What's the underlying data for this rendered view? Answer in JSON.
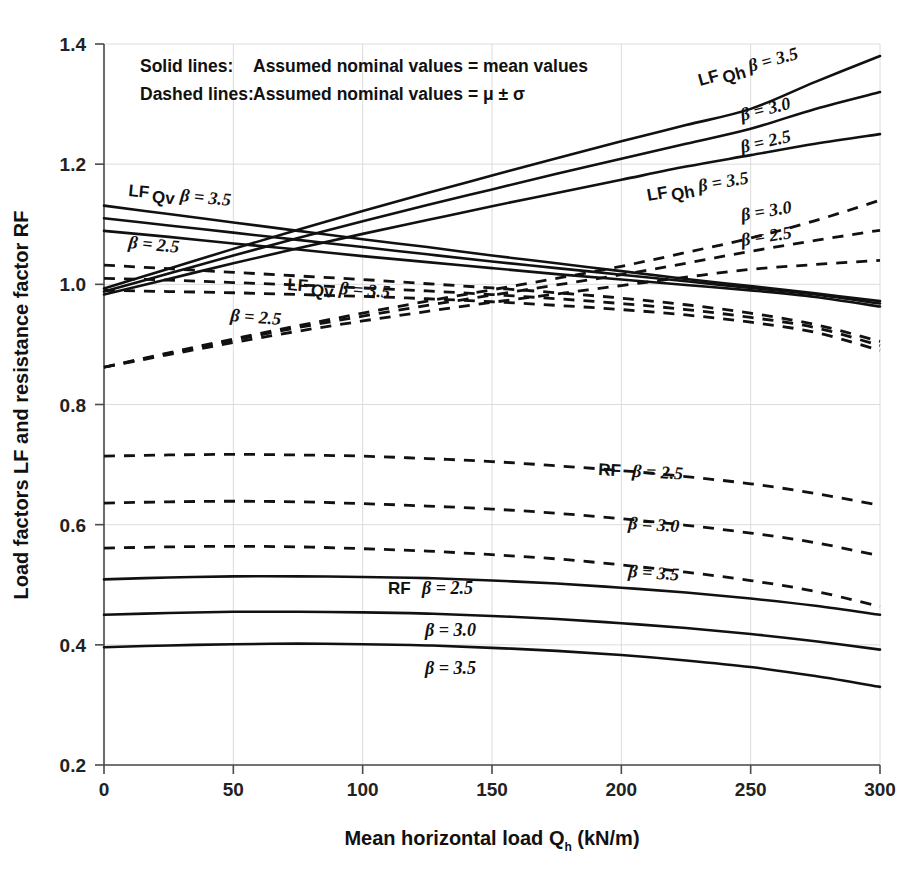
{
  "figure": {
    "background": "#ffffff",
    "ink": "#111111",
    "grid_color": "#d8d8d8"
  },
  "legend": {
    "line1_key": "Solid lines:",
    "line1_value": "Assumed nominal values = mean values",
    "line2_key": "Dashed lines:",
    "line2_value": "Assumed nominal values = μ ± σ"
  },
  "axes": {
    "x_title_main": "Mean horizontal load Q",
    "x_title_sub": "h",
    "x_title_unit": "  (kN/m)",
    "y_title_a": "Load factors ",
    "y_title_b": "LF",
    "y_title_c": " and resistance factor ",
    "y_title_d": "RF",
    "x_ticks": [
      "0",
      "50",
      "100",
      "150",
      "200",
      "250",
      "300"
    ],
    "y_ticks": [
      "0.2",
      "0.4",
      "0.6",
      "0.8",
      "1.0",
      "1.2",
      "1.4"
    ]
  },
  "annotations": [
    {
      "name": "lf-qh-solid-35",
      "prefix": "LF",
      "sub": "Qh",
      "beta": "β = 3.5",
      "x": 700,
      "y": 86,
      "rot": -15.5
    },
    {
      "name": "lf-qh-solid-30",
      "prefix": "",
      "sub": "",
      "beta": "β = 3.0",
      "x": 742,
      "y": 121,
      "rot": -14.0
    },
    {
      "name": "lf-qh-solid-25",
      "prefix": "",
      "sub": "",
      "beta": "β = 2.5",
      "x": 742,
      "y": 153,
      "rot": -13.0
    },
    {
      "name": "lf-qh-dashed-35",
      "prefix": "LF",
      "sub": "Qh",
      "beta": "β = 3.5",
      "x": 648,
      "y": 201,
      "rot": -10.0
    },
    {
      "name": "lf-qh-dashed-30",
      "prefix": "",
      "sub": "",
      "beta": "β = 3.0",
      "x": 742,
      "y": 221,
      "rot": -9.5
    },
    {
      "name": "lf-qh-dashed-25",
      "prefix": "",
      "sub": "",
      "beta": "β = 2.5",
      "x": 742,
      "y": 246,
      "rot": -9.0
    },
    {
      "name": "lf-qv-solid-35",
      "prefix": "LF",
      "sub": "Qv",
      "beta": "β = 3.5",
      "x": 128,
      "y": 196,
      "rot": 5.5
    },
    {
      "name": "lf-qv-solid-25",
      "prefix": "",
      "sub": "",
      "beta": "β = 2.5",
      "x": 128,
      "y": 248,
      "rot": 5.5
    },
    {
      "name": "lf-qv-dashed-35",
      "prefix": "LF",
      "sub": "Qv",
      "beta": "β = 3.5",
      "x": 287,
      "y": 290,
      "rot": 4.5
    },
    {
      "name": "lf-qv-dashed-25",
      "prefix": "",
      "sub": "",
      "beta": "β = 2.5",
      "x": 230,
      "y": 321,
      "rot": 4.5
    },
    {
      "name": "rf-dashed-25",
      "prefix": "RF",
      "sub": "",
      "beta": "β = 2.5",
      "x": 598,
      "y": 475,
      "rot": 3.0
    },
    {
      "name": "rf-dashed-30",
      "prefix": "",
      "sub": "",
      "beta": "β = 3.0",
      "x": 628,
      "y": 529,
      "rot": 3.5
    },
    {
      "name": "rf-dashed-35",
      "prefix": "",
      "sub": "",
      "beta": "β = 3.5",
      "x": 628,
      "y": 577,
      "rot": 4.0
    },
    {
      "name": "rf-solid-25",
      "prefix": "RF",
      "sub": "",
      "beta": "β = 2.5",
      "x": 388,
      "y": 594,
      "rot": 0
    },
    {
      "name": "rf-solid-30",
      "prefix": "",
      "sub": "",
      "beta": "β = 3.0",
      "x": 425,
      "y": 636,
      "rot": 0
    },
    {
      "name": "rf-solid-35",
      "prefix": "",
      "sub": "",
      "beta": "β = 3.5",
      "x": 425,
      "y": 674,
      "rot": 0
    }
  ],
  "chart_data": {
    "type": "line",
    "title": "",
    "xlabel": "Mean horizontal load Qh (kN/m)",
    "ylabel": "Load factors LF and resistance factor RF",
    "xlim": [
      0,
      300
    ],
    "ylim": [
      0.2,
      1.4
    ],
    "grid": true,
    "legend_position": "inside-top-left",
    "x": [
      0,
      25,
      50,
      75,
      100,
      125,
      150,
      175,
      200,
      225,
      250,
      275,
      300
    ],
    "series": [
      {
        "name": "LF_Qh  β = 3.5 (solid)",
        "group": "LF_Qh",
        "beta": 3.5,
        "style": "solid",
        "values": [
          0.993,
          1.026,
          1.059,
          1.091,
          1.122,
          1.152,
          1.181,
          1.21,
          1.238,
          1.265,
          1.292,
          1.337,
          1.38
        ]
      },
      {
        "name": "LF_Qh  β = 3.0 (solid)",
        "group": "LF_Qh",
        "beta": 3.0,
        "style": "solid",
        "values": [
          0.988,
          1.018,
          1.048,
          1.077,
          1.105,
          1.132,
          1.158,
          1.184,
          1.209,
          1.234,
          1.259,
          1.292,
          1.32
        ]
      },
      {
        "name": "LF_Qh  β = 2.5 (solid)",
        "group": "LF_Qh",
        "beta": 2.5,
        "style": "solid",
        "values": [
          0.983,
          1.009,
          1.035,
          1.06,
          1.084,
          1.107,
          1.13,
          1.152,
          1.174,
          1.196,
          1.215,
          1.234,
          1.25
        ]
      },
      {
        "name": "LF_Qh  β = 3.5 (dashed)",
        "group": "LF_Qh",
        "beta": 3.5,
        "style": "dashed",
        "values": [
          0.862,
          0.886,
          0.909,
          0.931,
          0.952,
          0.972,
          0.991,
          1.01,
          1.03,
          1.053,
          1.077,
          1.106,
          1.14
        ]
      },
      {
        "name": "LF_Qh  β = 3.0 (dashed)",
        "group": "LF_Qh",
        "beta": 3.0,
        "style": "dashed",
        "values": [
          0.862,
          0.885,
          0.907,
          0.928,
          0.947,
          0.965,
          0.982,
          0.999,
          1.016,
          1.035,
          1.055,
          1.073,
          1.09
        ]
      },
      {
        "name": "LF_Qh  β = 2.5 (dashed)",
        "group": "LF_Qh",
        "beta": 2.5,
        "style": "dashed",
        "values": [
          0.862,
          0.883,
          0.903,
          0.922,
          0.939,
          0.955,
          0.97,
          0.984,
          0.998,
          1.012,
          1.025,
          1.033,
          1.04
        ]
      },
      {
        "name": "LF_Qv  β = 3.5 (solid)",
        "group": "LF_Qv",
        "beta": 3.5,
        "style": "solid",
        "values": [
          1.131,
          1.117,
          1.103,
          1.089,
          1.075,
          1.062,
          1.048,
          1.035,
          1.022,
          1.009,
          0.997,
          0.985,
          0.972
        ]
      },
      {
        "name": "LF_Qv  β = 3.0 (solid)",
        "group": "LF_Qv",
        "beta": 3.0,
        "style": "solid",
        "values": [
          1.11,
          1.098,
          1.086,
          1.074,
          1.062,
          1.05,
          1.038,
          1.027,
          1.016,
          1.005,
          0.994,
          0.983,
          0.968
        ]
      },
      {
        "name": "LF_Qv  β = 2.5 (solid)",
        "group": "LF_Qv",
        "beta": 2.5,
        "style": "solid",
        "values": [
          1.089,
          1.079,
          1.068,
          1.058,
          1.047,
          1.037,
          1.027,
          1.017,
          1.008,
          0.999,
          0.99,
          0.979,
          0.963
        ]
      },
      {
        "name": "LF_Qv  β = 3.5 (dashed)",
        "group": "LF_Qv",
        "beta": 3.5,
        "style": "dashed",
        "values": [
          1.032,
          1.026,
          1.02,
          1.014,
          1.008,
          1.001,
          0.994,
          0.986,
          0.977,
          0.966,
          0.952,
          0.933,
          0.905
        ]
      },
      {
        "name": "LF_Qv  β = 3.0 (dashed)",
        "group": "LF_Qv",
        "beta": 3.0,
        "style": "dashed",
        "values": [
          1.01,
          1.007,
          1.003,
          0.999,
          0.994,
          0.989,
          0.983,
          0.976,
          0.968,
          0.958,
          0.945,
          0.928,
          0.898
        ]
      },
      {
        "name": "LF_Qv  β = 2.5 (dashed)",
        "group": "LF_Qv",
        "beta": 2.5,
        "style": "dashed",
        "values": [
          0.99,
          0.988,
          0.986,
          0.983,
          0.98,
          0.976,
          0.971,
          0.965,
          0.958,
          0.949,
          0.937,
          0.92,
          0.89
        ]
      },
      {
        "name": "RF  β = 2.5 (dashed)",
        "group": "RF",
        "beta": 2.5,
        "style": "dashed",
        "values": [
          0.714,
          0.716,
          0.717,
          0.716,
          0.714,
          0.71,
          0.705,
          0.698,
          0.69,
          0.68,
          0.668,
          0.652,
          0.632
        ]
      },
      {
        "name": "RF  β = 3.0 (dashed)",
        "group": "RF",
        "beta": 3.0,
        "style": "dashed",
        "values": [
          0.636,
          0.638,
          0.639,
          0.638,
          0.635,
          0.631,
          0.626,
          0.619,
          0.61,
          0.599,
          0.586,
          0.57,
          0.548
        ]
      },
      {
        "name": "RF  β = 3.5 (dashed)",
        "group": "RF",
        "beta": 3.5,
        "style": "dashed",
        "values": [
          0.561,
          0.563,
          0.564,
          0.563,
          0.56,
          0.556,
          0.55,
          0.543,
          0.533,
          0.521,
          0.507,
          0.489,
          0.464
        ]
      },
      {
        "name": "RF  β = 2.5 (solid)",
        "group": "RF",
        "beta": 2.5,
        "style": "solid",
        "values": [
          0.509,
          0.512,
          0.514,
          0.514,
          0.513,
          0.511,
          0.507,
          0.502,
          0.495,
          0.487,
          0.477,
          0.465,
          0.45
        ]
      },
      {
        "name": "RF  β = 3.0 (solid)",
        "group": "RF",
        "beta": 3.0,
        "style": "solid",
        "values": [
          0.45,
          0.453,
          0.455,
          0.455,
          0.454,
          0.452,
          0.448,
          0.443,
          0.436,
          0.428,
          0.418,
          0.406,
          0.392
        ]
      },
      {
        "name": "RF  β = 3.5 (solid)",
        "group": "RF",
        "beta": 3.5,
        "style": "solid",
        "values": [
          0.396,
          0.399,
          0.401,
          0.402,
          0.401,
          0.399,
          0.395,
          0.39,
          0.383,
          0.374,
          0.363,
          0.348,
          0.33
        ]
      }
    ]
  }
}
